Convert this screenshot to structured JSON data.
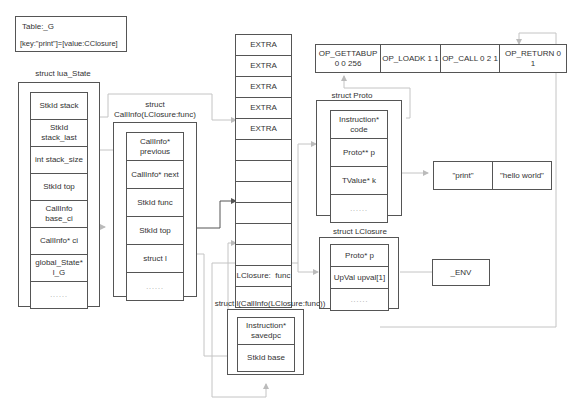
{
  "table_g": {
    "title": "Table:_G",
    "entry": "[key:\"print\"]=[value:CClosure]"
  },
  "lua_state": {
    "title": "struct lua_State",
    "fields": [
      "StkId stack",
      "StkId stack_last",
      "int stack_size",
      "StkId top",
      "CallInfo base_ci",
      "CallInfo* ci",
      "global_State* l_G",
      "......"
    ]
  },
  "callinfo": {
    "title_line1": "struct",
    "title_line2": "CallInfo(LClosure:func)",
    "fields": [
      "CallInfo* previous",
      "CallInfo* next",
      "StkId func",
      "StkId top",
      "struct l",
      "......"
    ]
  },
  "stack": {
    "cells": [
      "EXTRA",
      "EXTRA",
      "EXTRA",
      "EXTRA",
      "EXTRA",
      "",
      "",
      "",
      "",
      "",
      "",
      "LClosure:  func",
      ""
    ]
  },
  "instructions": {
    "cells": [
      "OP_GETTABUP 0 0 256",
      "OP_LOADK 1 1",
      "OP_CALL 0 2 1",
      "OP_RETURN 0 1"
    ]
  },
  "proto": {
    "title": "struct Proto",
    "fields": [
      "Instruction* code",
      "Proto** p",
      "TValue* k",
      "......"
    ]
  },
  "constants": {
    "cells": [
      "\"print\"",
      "\"hello world\""
    ]
  },
  "lclosure": {
    "title": "struct LClosure",
    "fields": [
      "Proto* p",
      "UpVal upval[1]",
      "......"
    ]
  },
  "env": {
    "label": "_ENV"
  },
  "callinfo_l": {
    "title": "struct l(CallInfo(LClosure:func))",
    "fields": [
      "Instruction* savedpc",
      "StkId base"
    ]
  },
  "colors": {
    "border": "#555555",
    "wire": "#bbbbbb",
    "wire_dark": "#555555"
  }
}
